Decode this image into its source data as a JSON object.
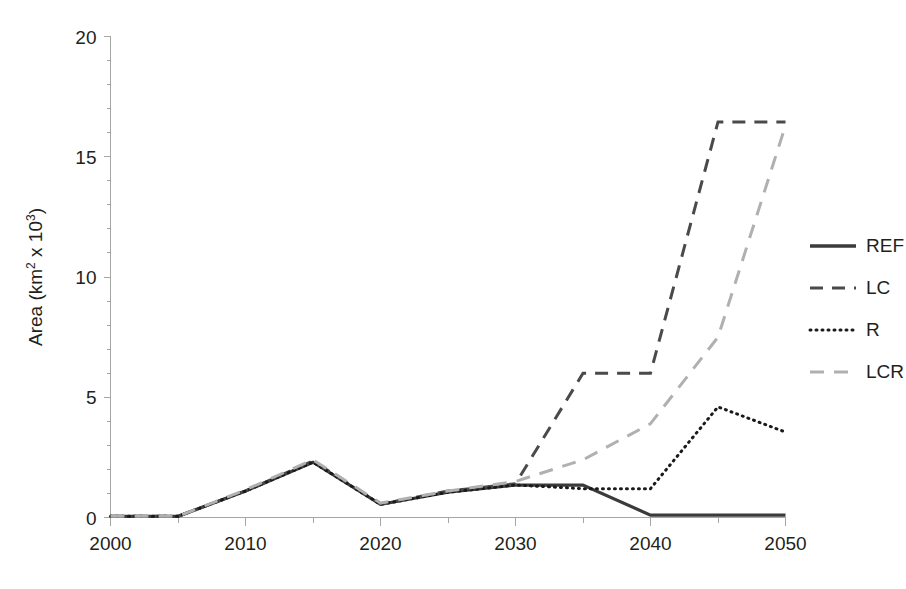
{
  "chart_data": {
    "type": "line",
    "title": "",
    "xlabel": "",
    "ylabel": "Area (km² x 10³)",
    "ylabel_parts": {
      "base": "Area (km",
      "sup1": "2",
      "mid": " x 10",
      "sup2": "3",
      "tail": ")"
    },
    "xlim": [
      2000,
      2050
    ],
    "ylim": [
      0,
      20
    ],
    "x_ticks": [
      2000,
      2010,
      2020,
      2030,
      2040,
      2050
    ],
    "x_tick_labels": [
      "2000",
      "2010",
      "2020",
      "2030",
      "2040",
      "2050"
    ],
    "x_minor_ticks": [
      2005,
      2015,
      2025,
      2035,
      2045
    ],
    "y_ticks": [
      0,
      5,
      10,
      15,
      20
    ],
    "y_tick_labels": [
      "0",
      "5",
      "10",
      "15",
      "20"
    ],
    "grid": false,
    "legend_position": "right",
    "x": [
      2000,
      2005,
      2010,
      2015,
      2020,
      2025,
      2030,
      2035,
      2040,
      2045,
      2050
    ],
    "series": [
      {
        "name": "REF",
        "label": "REF",
        "color": "#3b3b3b",
        "width": 3.2,
        "dash": "none",
        "values": [
          0.05,
          0.05,
          1.1,
          2.3,
          0.55,
          1.05,
          1.35,
          1.35,
          0.1,
          0.1,
          0.1
        ]
      },
      {
        "name": "LC",
        "label": "LC",
        "color": "#4a4a4a",
        "width": 3.0,
        "dash": "13,9",
        "values": [
          0.05,
          0.05,
          1.1,
          2.35,
          0.55,
          1.1,
          1.4,
          6.0,
          6.0,
          16.45,
          16.45
        ]
      },
      {
        "name": "R",
        "label": "R",
        "color": "#1a1a1a",
        "width": 3.0,
        "dash": "1,5",
        "values": [
          0.05,
          0.05,
          1.1,
          2.3,
          0.55,
          1.05,
          1.35,
          1.2,
          1.2,
          4.6,
          3.55
        ]
      },
      {
        "name": "LCR",
        "label": "LCR",
        "color": "#b0b0b0",
        "width": 3.0,
        "dash": "14,10",
        "values": [
          0.05,
          0.05,
          1.15,
          2.4,
          0.6,
          1.1,
          1.5,
          2.4,
          3.9,
          7.5,
          16.3
        ]
      }
    ]
  },
  "legend": {
    "items": [
      {
        "label": "REF",
        "color": "#3b3b3b",
        "dash": "none",
        "width": 3.4
      },
      {
        "label": "LC",
        "color": "#4a4a4a",
        "dash": "13,9",
        "width": 3.0
      },
      {
        "label": "R",
        "color": "#1a1a1a",
        "dash": "1,5",
        "width": 3.0
      },
      {
        "label": "LCR",
        "color": "#b0b0b0",
        "dash": "14,10",
        "width": 3.0
      }
    ]
  }
}
